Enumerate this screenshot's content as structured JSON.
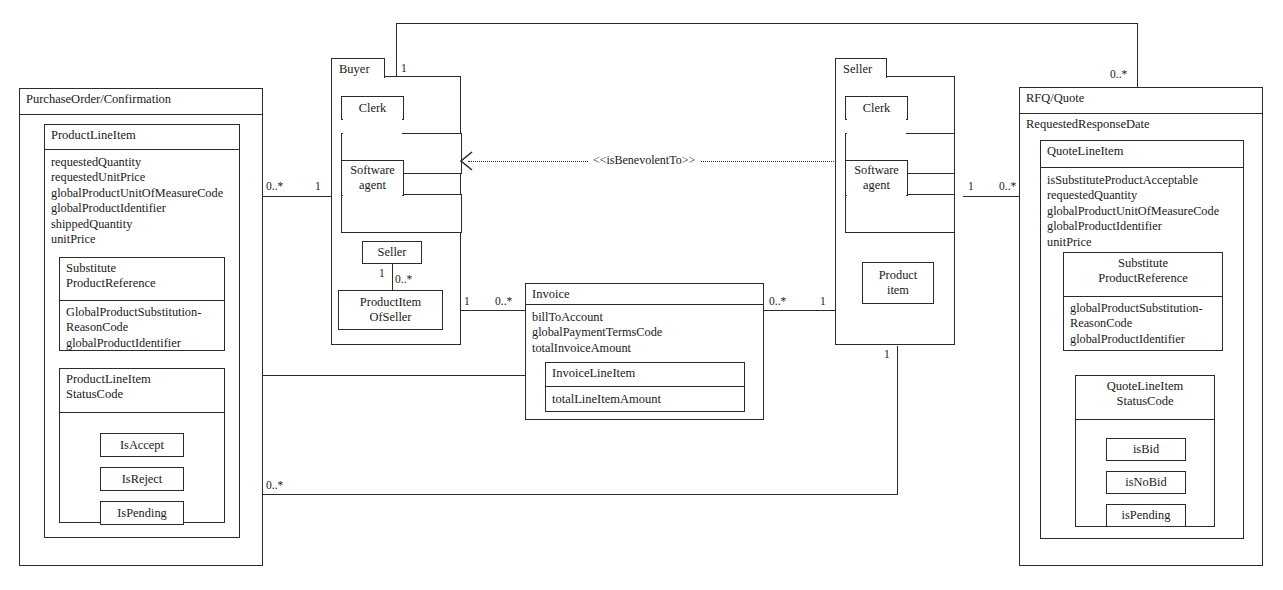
{
  "diagram": {
    "stereotype": "<<isBenevolentTo>>"
  },
  "packages": {
    "purchase_order": {
      "name": "PurchaseOrder/Confirmation",
      "product_line_item": {
        "name": "ProductLineItem",
        "attributes": "requestedQuantity\nrequestedUnitPrice\nglobalProductUnitOfMeasureCode\nglobalProductIdentifier\nshippedQuantity\nunitPrice"
      },
      "substitute_product_reference": {
        "name": "Substitute\nProductReference",
        "attributes": "GlobalProductSubstitution-\nReasonCode\nglobalProductIdentifier"
      },
      "status_code": {
        "name": "ProductLineItem\nStatusCode",
        "states": [
          "IsAccept",
          "IsReject",
          "IsPending"
        ]
      }
    },
    "buyer": {
      "name": "Buyer",
      "clerk": "Clerk",
      "software_agent": "Software\nagent",
      "seller": "Seller",
      "product_item_of_seller": "ProductItem\nOfSeller"
    },
    "seller": {
      "name": "Seller",
      "clerk": "Clerk",
      "software_agent": "Software\nagent",
      "product_item": "Product\nitem"
    },
    "rfq_quote": {
      "name": "RFQ/Quote",
      "requested_response_date": "RequestedResponseDate",
      "quote_line_item": {
        "name": "QuoteLineItem",
        "attributes": "isSubstituteProductAcceptable\nrequestedQuantity\nglobalProductUnitOfMeasureCode\nglobalProductIdentifier\nunitPrice"
      },
      "substitute_product_reference": {
        "name": "Substitute\nProductReference",
        "attributes": "globalProductSubstitution-\nReasonCode\nglobalProductIdentifier"
      },
      "status_code": {
        "name": "QuoteLineItem\nStatusCode",
        "states": [
          "isBid",
          "isNoBid",
          "isPending"
        ]
      }
    },
    "invoice": {
      "name": "Invoice",
      "attributes": "billToAccount\nglobalPaymentTermsCode\ntotalInvoiceAmount",
      "line_item": {
        "name": "InvoiceLineItem",
        "attributes": "totalLineItemAmount"
      }
    }
  },
  "multiplicities": {
    "po_to_buyer_left": "0..*",
    "po_to_buyer_right": "1",
    "buyer_top": "1",
    "rfq_top": "0..*",
    "seller_to_rfq_left": "1",
    "seller_to_rfq_right": "0..*",
    "buyer_seller_sub": "1",
    "buyer_productitem_sub": "0..*",
    "productitem_to_invoice": "1",
    "invoice_left": "0..*",
    "invoice_right": "0..*",
    "invoice_to_seller": "1",
    "po_to_invoiceline_left": "1",
    "invoiceline_right": "1",
    "po_bottom": "0..*",
    "seller_bottom": "1"
  },
  "colors": {
    "line": "#2b2b2b",
    "background": "#ffffff",
    "text": "#1a1a1a"
  }
}
